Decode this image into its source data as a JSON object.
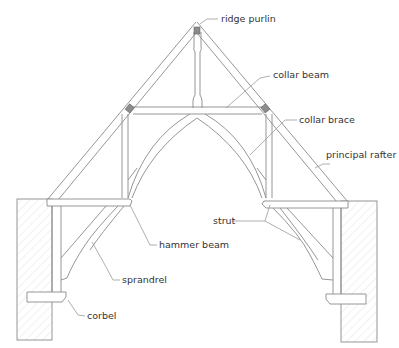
{
  "diagram": {
    "type": "hammer-beam roof truss",
    "labels": {
      "ridge_purlin": "ridge purlin",
      "collar_beam": "collar beam",
      "collar_brace": "collar brace",
      "principal_rafter": "principal rafter",
      "strut": "strut",
      "hammer_beam": "hammer beam",
      "sprandrel": "sprandrel",
      "corbel": "corbel"
    },
    "colors": {
      "line": "#8a8a8a",
      "text": "#333333",
      "purlin": "#8c8c8c"
    }
  }
}
